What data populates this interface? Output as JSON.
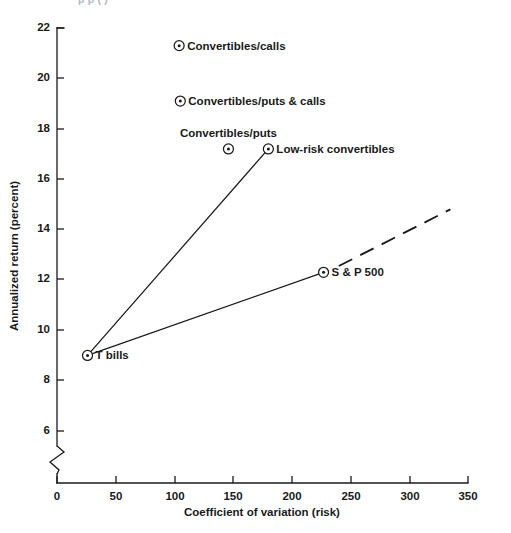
{
  "figure": {
    "clipped_header_text": "p       p    (    )"
  },
  "chart_data": {
    "type": "scatter",
    "title": "",
    "xlabel": "Coefficient of variation (risk)",
    "ylabel": "Annualized return (percent)",
    "xlim": [
      0,
      350
    ],
    "ylim": [
      5.2,
      22
    ],
    "grid": false,
    "legend": "none",
    "axis_break_y": true,
    "xticks": [
      0,
      50,
      100,
      150,
      200,
      250,
      300,
      350
    ],
    "xticklabels": [
      "0",
      "50",
      "100",
      "150",
      "200",
      "250",
      "300",
      "350"
    ],
    "yticks": [
      6,
      8,
      10,
      12,
      14,
      16,
      18,
      20,
      22
    ],
    "yticklabels": [
      "6",
      "8",
      "10",
      "12",
      "14",
      "16",
      "18",
      "20",
      "22"
    ],
    "points": [
      {
        "label": "Convertibles/calls",
        "x": 104,
        "y": 21.3,
        "label_pos": "right"
      },
      {
        "label": "Convertibles/puts & calls",
        "x": 105,
        "y": 19.1,
        "label_pos": "right"
      },
      {
        "label": "Convertibles/puts",
        "x": 146,
        "y": 17.2,
        "label_pos": "above"
      },
      {
        "label": "Low-risk convertibles",
        "x": 180,
        "y": 17.2,
        "label_pos": "right"
      },
      {
        "label": "S & P 500",
        "x": 227,
        "y": 12.3,
        "label_pos": "right"
      },
      {
        "label": "T bills",
        "x": 26,
        "y": 9.0,
        "label_pos": "right"
      }
    ],
    "series": [
      {
        "name": "Convertibles frontier",
        "style": "solid",
        "points": [
          {
            "x": 26,
            "y": 9.0
          },
          {
            "x": 180,
            "y": 17.2
          }
        ]
      },
      {
        "name": "Capital market line",
        "style": "solid",
        "points": [
          {
            "x": 26,
            "y": 9.0
          },
          {
            "x": 227,
            "y": 12.3
          }
        ]
      },
      {
        "name": "Capital market line extension",
        "style": "dashed",
        "points": [
          {
            "x": 240,
            "y": 12.55
          },
          {
            "x": 335,
            "y": 14.8
          }
        ]
      }
    ]
  }
}
